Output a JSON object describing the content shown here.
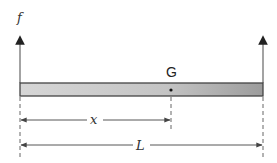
{
  "diagram": {
    "force_label": "f",
    "center_label": "G",
    "distance_label": "x",
    "length_label": "L",
    "colors": {
      "bar_fill_light": "#d9d9d9",
      "bar_fill_dark": "#9a9a9a",
      "bar_stroke": "#444444",
      "line": "#444444",
      "dashed": "#555555"
    }
  }
}
